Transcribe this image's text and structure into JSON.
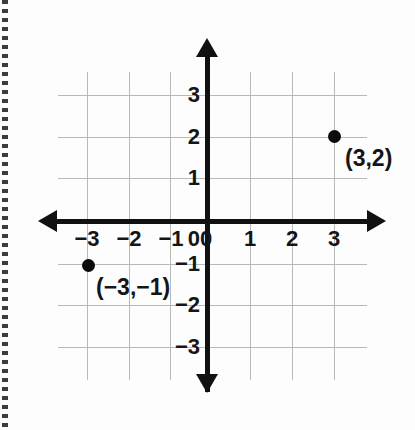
{
  "chart_data": {
    "type": "scatter",
    "title": "",
    "xlabel": "",
    "ylabel": "",
    "xlim": [
      -3.5,
      3.5
    ],
    "ylim": [
      -3.5,
      3.5
    ],
    "grid": true,
    "legend": "none",
    "x_ticks": [
      "−3",
      "−2",
      "−1",
      "0",
      "1",
      "2",
      "3"
    ],
    "x_tick_values": [
      -3,
      -2,
      -1,
      0,
      1,
      2,
      3
    ],
    "y_ticks": [
      "3",
      "2",
      "1",
      "0",
      "−1",
      "−2",
      "−3"
    ],
    "y_tick_values": [
      3,
      2,
      1,
      0,
      -1,
      -2,
      -3
    ],
    "points": [
      {
        "x": 3,
        "y": 2,
        "label": "(3,2)"
      },
      {
        "x": -3,
        "y": -1,
        "label": "(−3,−1)"
      }
    ],
    "axes_style": "double-arrow-cartesian",
    "colors": {
      "axis": "#111111",
      "grid": "#b9b9b9",
      "point": "#0b0b0b",
      "background": "#fdfdfd",
      "text": "#151515"
    }
  },
  "axes": {
    "x_labels": [
      {
        "text": "−3",
        "left": 67
      },
      {
        "text": "−2",
        "left": 109
      },
      {
        "text": "−1",
        "left": 151
      },
      {
        "text": "0",
        "left": 186
      },
      {
        "text": "1",
        "left": 230
      },
      {
        "text": "2",
        "left": 272
      },
      {
        "text": "3",
        "left": 314
      }
    ],
    "y_labels": [
      {
        "text": "3",
        "top": 84
      },
      {
        "text": "2",
        "top": 126
      },
      {
        "text": "1",
        "top": 167
      },
      {
        "text": "0",
        "top": 228
      },
      {
        "text": "−1",
        "top": 253
      },
      {
        "text": "−2",
        "top": 294
      },
      {
        "text": "−3",
        "top": 336
      }
    ]
  },
  "grid": {
    "vertical_x": [
      87,
      129,
      170,
      250,
      292,
      334
    ],
    "horizontal_y": [
      95,
      137,
      178,
      264,
      305,
      347
    ]
  },
  "points": [
    {
      "name": "point-3-2",
      "label": "(3,2)",
      "dot_left": 328,
      "dot_top": 130,
      "label_left": 345,
      "label_top": 147
    },
    {
      "name": "point-neg3-neg1",
      "label": "(−3,−1)",
      "dot_left": 82,
      "dot_top": 259,
      "label_left": 96,
      "label_top": 276
    }
  ]
}
